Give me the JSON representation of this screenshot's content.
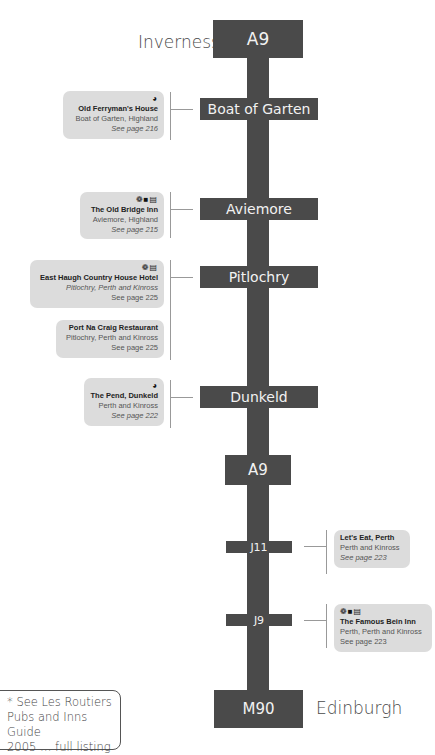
{
  "route": {
    "start_city": "Inverness",
    "end_city": "Edinburgh",
    "signs": [
      {
        "label": "A9",
        "type": "road"
      },
      {
        "label": "Boat of Garten",
        "type": "town"
      },
      {
        "label": "Aviemore",
        "type": "town"
      },
      {
        "label": "Pitlochry",
        "type": "town"
      },
      {
        "label": "Dunkeld",
        "type": "town"
      },
      {
        "label": "A9",
        "type": "road"
      },
      {
        "label": "J11",
        "type": "junction"
      },
      {
        "label": "J9",
        "type": "junction"
      },
      {
        "label": "M90",
        "type": "road"
      }
    ],
    "colors": {
      "road": "#4a4a4a",
      "card": "#dcdcdc",
      "sign_text": "#f2f2f2"
    }
  },
  "venues": [
    {
      "name": "Old Ferryman's House",
      "location": "Boat of Garten, Highland",
      "page": "See page 216",
      "icons": "◕"
    },
    {
      "name": "The Old Bridge Inn",
      "location": "Aviemore, Highland",
      "page": "See page 215",
      "icons": "❁■▤"
    },
    {
      "name": "East Haugh Country House Hotel",
      "location": "Pitlochry, Perth and Kinross",
      "page": "See page 225",
      "icons": "❁▤"
    },
    {
      "name": "Port Na Craig Restaurant",
      "location": "Pitlochry, Perth and Kinross",
      "page": "See page 225",
      "icons": ""
    },
    {
      "name": "The Pend, Dunkeld",
      "location": "Perth and Kinross",
      "page": "See page 222",
      "icons": "◕"
    },
    {
      "name": "Let's Eat, Perth",
      "location": "Perth and Kinross",
      "page": "See page 223",
      "icons": ""
    },
    {
      "name": "The Famous Bein Inn",
      "location": "Perth, Perth and Kinross",
      "page": "See page 223",
      "icons": "❁■▤"
    }
  ],
  "footnote": {
    "line1": "* See Les Routiers",
    "line2": "Pubs and Inns Guide",
    "line3": "2005 … full listing"
  }
}
